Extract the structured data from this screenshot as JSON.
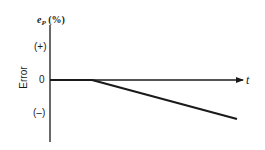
{
  "diagram": {
    "y_axis": {
      "symbol": "e",
      "subscript": "P",
      "unit": "(%)",
      "title": "Error",
      "ticks": [
        {
          "label": "(+)",
          "y": 47
        },
        {
          "label": "0",
          "y": 80
        },
        {
          "label": "(–)",
          "y": 113
        }
      ]
    },
    "x_axis": {
      "label": "t"
    },
    "error_line": {
      "description": "Error stays at zero, then decreases linearly (negative ramp)",
      "points": [
        [
          50,
          80
        ],
        [
          92,
          80
        ],
        [
          237,
          119
        ]
      ]
    },
    "colors": {
      "ink": "#1a1a1a",
      "background": "#ffffff"
    }
  }
}
